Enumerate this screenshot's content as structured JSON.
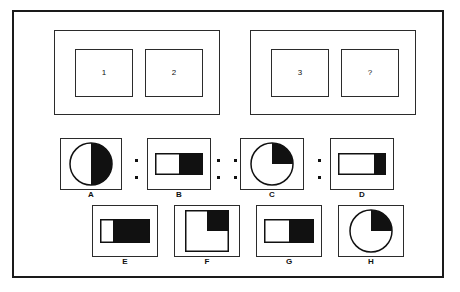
{
  "puzzle": {
    "type": "visual-analogy-matrix",
    "frame_color": "#1a1a1a",
    "fill_color": "#111111",
    "background_color": "#ffffff",
    "prompt_row": {
      "left_group": {
        "cells": [
          {
            "label": "1"
          },
          {
            "label": "2"
          }
        ]
      },
      "right_group": {
        "cells": [
          {
            "label": "3"
          },
          {
            "label": "?"
          }
        ]
      }
    },
    "analogy_row": {
      "separators": {
        "ratio_left": ":",
        "proportion": "::",
        "ratio_right": ":"
      },
      "figures": [
        {
          "caption": "A",
          "shape": "circle",
          "fill_name": "right-half-filled",
          "fill_fraction": 0.5
        },
        {
          "caption": "B",
          "shape": "rectangle",
          "fill_name": "right-half-filled",
          "fill_fraction": 0.5
        },
        {
          "caption": "C",
          "shape": "circle",
          "fill_name": "upper-right-quadrant-filled",
          "fill_fraction": 0.25
        },
        {
          "caption": "D",
          "shape": "rectangle",
          "fill_name": "right-quarter-filled",
          "fill_fraction": 0.25
        }
      ]
    },
    "answer_options": [
      {
        "caption": "E",
        "shape": "rectangle",
        "fill_name": "right-three-quarters-filled",
        "fill_fraction": 0.75
      },
      {
        "caption": "F",
        "shape": "square",
        "fill_name": "upper-right-quadrant-filled",
        "fill_fraction": 0.25
      },
      {
        "caption": "G",
        "shape": "rectangle",
        "fill_name": "right-half-filled",
        "fill_fraction": 0.5
      },
      {
        "caption": "H",
        "shape": "circle",
        "fill_name": "upper-right-quadrant-filled",
        "fill_fraction": 0.25
      }
    ]
  }
}
